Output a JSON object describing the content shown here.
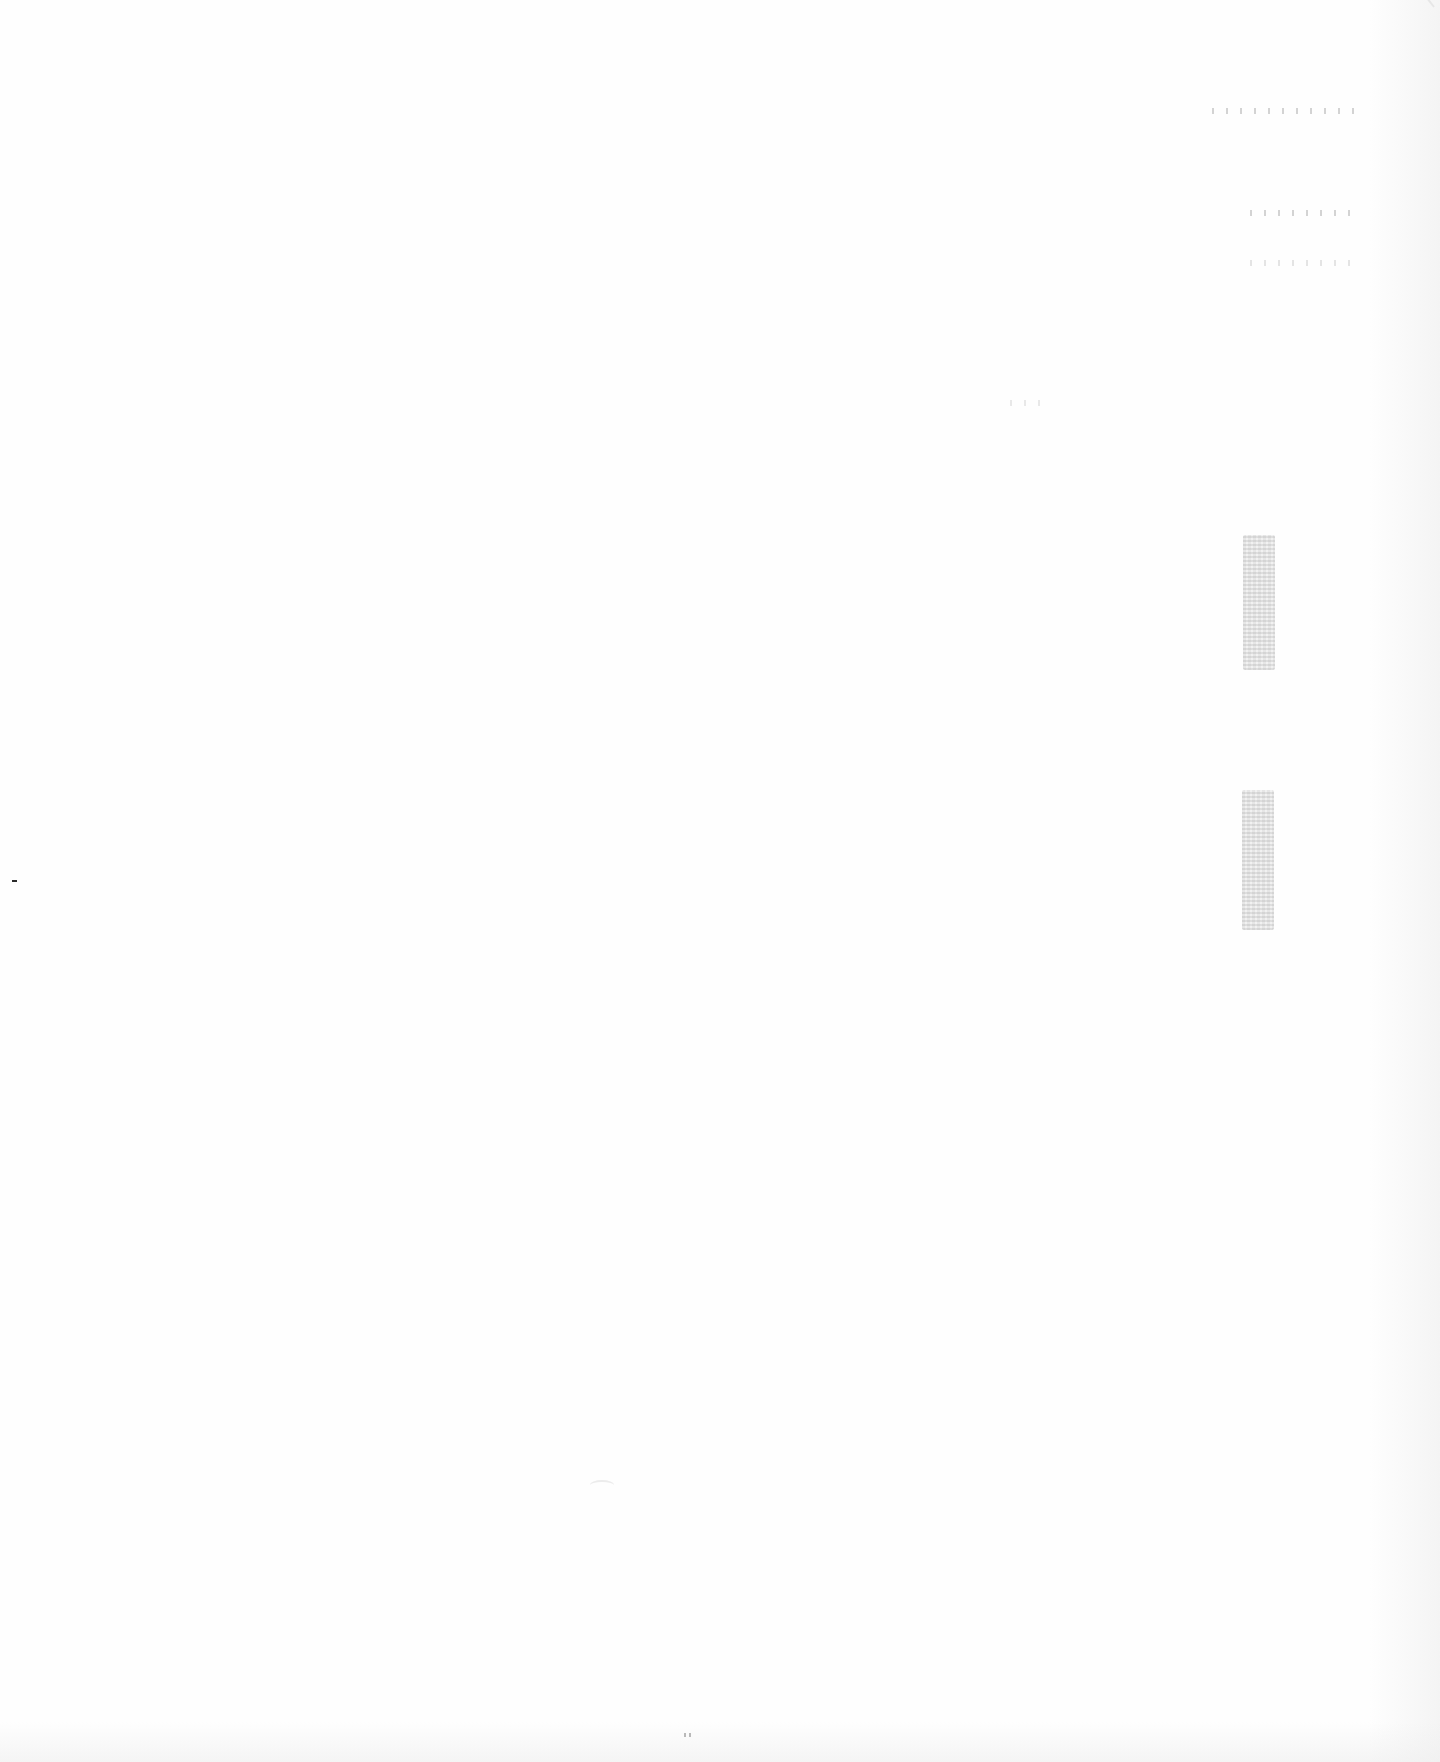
{
  "document": {
    "type": "blank scanned page",
    "text": "",
    "colors": {
      "paper": "#fefefe",
      "artifact": "#a0a0a0",
      "dash": "#2a2a2a"
    }
  }
}
